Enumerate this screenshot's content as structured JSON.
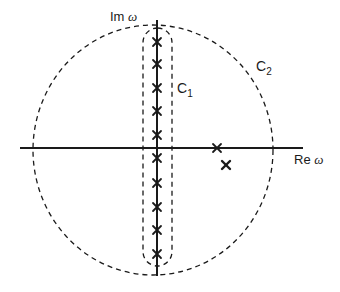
{
  "diagram": {
    "axes": {
      "real_label": "Re",
      "imag_label": "Im",
      "variable": "ω"
    },
    "contours": [
      {
        "id": "C1",
        "label": "C",
        "subscript": "1",
        "shape": "capsule enclosing imaginary-axis poles",
        "style": "dashed"
      },
      {
        "id": "C2",
        "label": "C",
        "subscript": "2",
        "shape": "large circle",
        "style": "dashed"
      }
    ],
    "poles": {
      "imaginary_axis_count": 10,
      "real_axis_marker": "x",
      "off_axis_marker": "x"
    },
    "colors": {
      "line": "#1a1a1a",
      "background": "#ffffff"
    }
  }
}
